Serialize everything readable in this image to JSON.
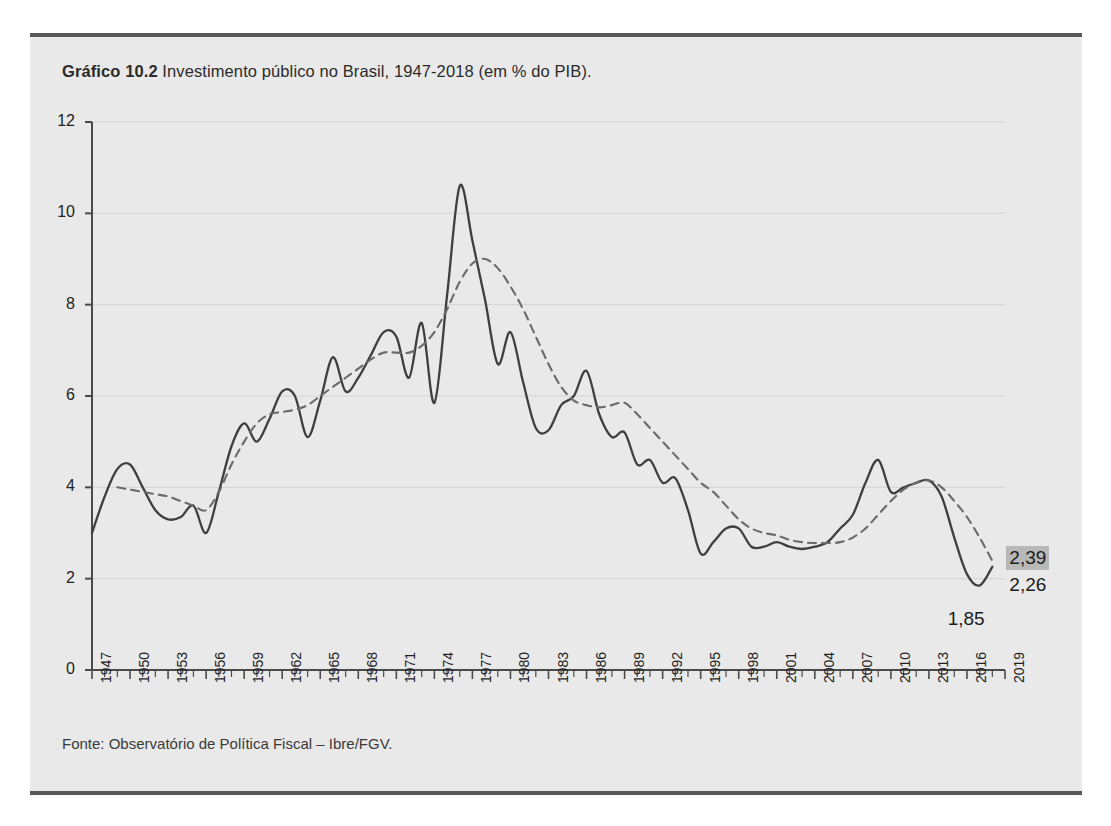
{
  "figure": {
    "caption_bold": "Gráfico 10.2",
    "caption_rest": " Investimento público no Brasil, 1947-2018 (em % do PIB).",
    "source": "Fonte: Observatório de Política Fiscal – Ibre/FGV.",
    "background_color": "#e9e9e9",
    "rule_color": "#58585a"
  },
  "annotations": {
    "trend_end": "2,39",
    "series_end": "2,26",
    "trough": "1,85"
  },
  "chart_data": {
    "type": "line",
    "title": "Gráfico 10.2 Investimento público no Brasil, 1947-2018 (em % do PIB).",
    "xlabel": "",
    "ylabel": "% do PIB",
    "xlim": [
      1947,
      2019
    ],
    "ylim": [
      0,
      12
    ],
    "yticks": [
      0,
      2,
      4,
      6,
      8,
      10,
      12
    ],
    "ytick_labels": [
      "0",
      "2",
      "4",
      "6",
      "8",
      "10",
      "12"
    ],
    "xticks": [
      1947,
      1950,
      1953,
      1956,
      1959,
      1962,
      1965,
      1968,
      1971,
      1974,
      1977,
      1980,
      1983,
      1986,
      1989,
      1992,
      1995,
      1998,
      2001,
      2004,
      2007,
      2010,
      2013,
      2016,
      2019
    ],
    "xtick_labels": [
      "1947",
      "1950",
      "1953",
      "1956",
      "1959",
      "1962",
      "1965",
      "1968",
      "1971",
      "1974",
      "1977",
      "1980",
      "1983",
      "1986",
      "1989",
      "1992",
      "1995",
      "1998",
      "2001",
      "2004",
      "2007",
      "2010",
      "2013",
      "2016",
      "2019"
    ],
    "grid": true,
    "legend": "none",
    "series": [
      {
        "name": "Investimento público (anual)",
        "style": "solid",
        "color": "#3f3f3f",
        "x": [
          1947,
          1948,
          1949,
          1950,
          1951,
          1952,
          1953,
          1954,
          1955,
          1956,
          1957,
          1958,
          1959,
          1960,
          1961,
          1962,
          1963,
          1964,
          1965,
          1966,
          1967,
          1968,
          1969,
          1970,
          1971,
          1972,
          1973,
          1974,
          1975,
          1976,
          1977,
          1978,
          1979,
          1980,
          1981,
          1982,
          1983,
          1984,
          1985,
          1986,
          1987,
          1988,
          1989,
          1990,
          1991,
          1992,
          1993,
          1994,
          1995,
          1996,
          1997,
          1998,
          1999,
          2000,
          2001,
          2002,
          2003,
          2004,
          2005,
          2006,
          2007,
          2008,
          2009,
          2010,
          2011,
          2012,
          2013,
          2014,
          2015,
          2016,
          2017,
          2018
        ],
        "values": [
          3.0,
          3.8,
          4.4,
          4.5,
          4.0,
          3.5,
          3.3,
          3.35,
          3.6,
          3.0,
          3.9,
          4.9,
          5.4,
          5.0,
          5.5,
          6.1,
          6.0,
          5.1,
          5.9,
          6.85,
          6.1,
          6.4,
          6.9,
          7.4,
          7.3,
          6.4,
          7.6,
          5.85,
          8.2,
          10.6,
          9.4,
          8.1,
          6.7,
          7.4,
          6.3,
          5.3,
          5.25,
          5.8,
          6.0,
          6.55,
          5.6,
          5.1,
          5.2,
          4.5,
          4.6,
          4.1,
          4.2,
          3.5,
          2.55,
          2.8,
          3.1,
          3.1,
          2.7,
          2.7,
          2.8,
          2.7,
          2.65,
          2.7,
          2.8,
          3.1,
          3.4,
          4.1,
          4.6,
          3.9,
          4.0,
          4.1,
          4.15,
          3.8,
          2.9,
          2.1,
          1.85,
          2.26
        ]
      },
      {
        "name": "Tendência (média móvel)",
        "style": "dashed",
        "color": "#6a6a6a",
        "x": [
          1949,
          1950,
          1951,
          1952,
          1953,
          1954,
          1955,
          1956,
          1957,
          1958,
          1959,
          1960,
          1961,
          1962,
          1963,
          1964,
          1965,
          1966,
          1967,
          1968,
          1969,
          1970,
          1971,
          1972,
          1973,
          1974,
          1975,
          1976,
          1977,
          1978,
          1979,
          1980,
          1981,
          1982,
          1983,
          1984,
          1985,
          1986,
          1987,
          1988,
          1989,
          1990,
          1991,
          1992,
          1993,
          1994,
          1995,
          1996,
          1997,
          1998,
          1999,
          2000,
          2001,
          2002,
          2003,
          2004,
          2005,
          2006,
          2007,
          2008,
          2009,
          2010,
          2011,
          2012,
          2013,
          2014,
          2015,
          2016,
          2017,
          2018
        ],
        "values": [
          4.0,
          3.95,
          3.9,
          3.85,
          3.8,
          3.7,
          3.6,
          3.5,
          3.9,
          4.5,
          5.0,
          5.4,
          5.6,
          5.65,
          5.7,
          5.8,
          6.0,
          6.2,
          6.4,
          6.6,
          6.8,
          6.95,
          6.95,
          6.95,
          7.1,
          7.4,
          7.9,
          8.5,
          8.9,
          9.0,
          8.8,
          8.4,
          7.9,
          7.3,
          6.7,
          6.2,
          5.9,
          5.8,
          5.75,
          5.8,
          5.85,
          5.6,
          5.3,
          5.0,
          4.7,
          4.4,
          4.1,
          3.9,
          3.6,
          3.3,
          3.1,
          3.0,
          2.95,
          2.85,
          2.8,
          2.78,
          2.78,
          2.8,
          2.9,
          3.1,
          3.4,
          3.7,
          3.95,
          4.1,
          4.15,
          4.0,
          3.7,
          3.35,
          2.9,
          2.39
        ]
      }
    ]
  }
}
